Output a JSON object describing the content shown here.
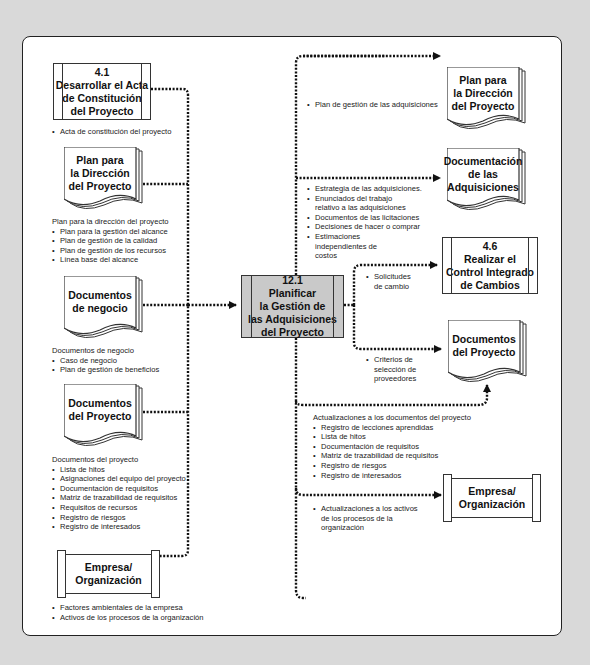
{
  "diagram": {
    "colors": {
      "background": "#d9d9d9",
      "frame": "#ffffff",
      "center_fill": "#c9c9c9",
      "line": "#111111"
    },
    "center": {
      "number": "12.1",
      "lines": [
        "Planificar",
        "la Gestión de",
        "las Adquisiciones",
        "del Proyecto"
      ]
    },
    "inputs": [
      {
        "id": "acta",
        "shape": "process",
        "lines": [
          "4.1",
          "Desarrollar el Acta",
          "de Constitución",
          "del Proyecto"
        ],
        "heading": "",
        "items": [
          "Acta de constitución del proyecto"
        ]
      },
      {
        "id": "plan",
        "shape": "document",
        "lines": [
          "Plan para",
          "la Dirección",
          "del Proyecto"
        ],
        "heading": "Plan para la dirección del proyecto",
        "items": [
          "Plan para la gestión del alcance",
          "Plan de gestión de la calidad",
          "Plan de gestión de los recursos",
          "Línea base del alcance"
        ]
      },
      {
        "id": "negocio",
        "shape": "document",
        "lines": [
          "Documentos",
          "de negocio"
        ],
        "heading": "Documentos de negocio",
        "items": [
          "Caso de negocio",
          "Plan de gestión de beneficios"
        ]
      },
      {
        "id": "docs",
        "shape": "document",
        "lines": [
          "Documentos",
          "del Proyecto"
        ],
        "heading": "Documentos del proyecto",
        "items": [
          "Lista de hitos",
          "Asignaciones del equipo del proyecto",
          "Documentación de requisitos",
          "Matriz de trazabilidad de requisitos",
          "Requisitos de recursos",
          "Registro de riesgos",
          "Registro de interesados"
        ]
      },
      {
        "id": "empresa",
        "shape": "scroll",
        "lines": [
          "Empresa/",
          "Organización"
        ],
        "heading": "",
        "items": [
          "Factores ambientales de la empresa",
          "Activos de los procesos de la organización"
        ]
      }
    ],
    "outputs": [
      {
        "id": "plan_out",
        "shape": "document",
        "lines": [
          "Plan para",
          "la Dirección",
          "del Proyecto"
        ],
        "heading": "",
        "items": [
          "Plan de gestión de las adquisiciones"
        ]
      },
      {
        "id": "docadq",
        "shape": "document",
        "lines": [
          "Documentación",
          "de las",
          "Adquisiciones"
        ],
        "heading": "",
        "items": [
          "Estrategia de las adquisiciones.",
          "Enunciados del trabajo relativo a las adquisiciones",
          "Documentos de las licitaciones",
          "Decisiones de hacer o comprar",
          "Estimaciones independientes de costos"
        ]
      },
      {
        "id": "control",
        "shape": "process",
        "lines": [
          "4.6",
          "Realizar el",
          "Control Integrado",
          "de Cambios"
        ],
        "heading": "",
        "items": [
          "Solicitudes de cambio"
        ]
      },
      {
        "id": "docs_out",
        "shape": "document",
        "lines": [
          "Documentos",
          "del Proyecto"
        ],
        "heading": "",
        "items": [
          "Criterios de selección de proveedores"
        ]
      },
      {
        "id": "updates",
        "shape": "none",
        "lines": [],
        "heading": "Actualizaciones a los documentos del proyecto",
        "items": [
          "Registro de lecciones aprendidas",
          "Lista de hitos",
          "Documentación de requisitos",
          "Matriz de trazabilidad de requisitos",
          "Registro de riesgos",
          "Registro de interesados"
        ]
      },
      {
        "id": "empresa_out",
        "shape": "scroll",
        "lines": [
          "Empresa/",
          "Organización"
        ],
        "heading": "",
        "items": [
          "Actualizaciones a los activos de los procesos de la organización"
        ]
      }
    ]
  }
}
